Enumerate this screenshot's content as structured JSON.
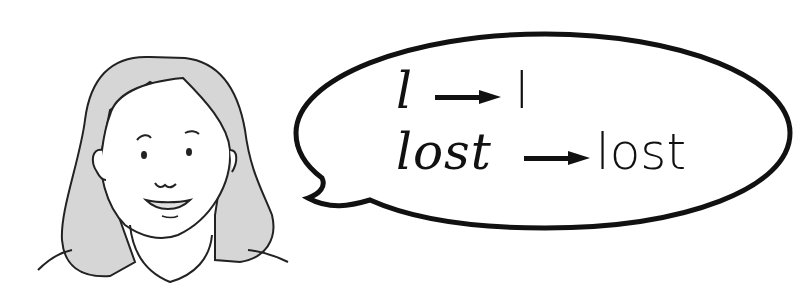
{
  "illustration": {
    "character": "girl-with-shoulder-length-hair",
    "speech_bubble": {
      "lines": [
        {
          "cursive": "l",
          "arrow": "right-arrow",
          "print": "l"
        },
        {
          "cursive": "lost",
          "arrow": "right-arrow",
          "print": "lost"
        }
      ]
    }
  },
  "colors": {
    "ink": "#111111",
    "hair_shade": "#c8c8c8",
    "background": "#ffffff"
  }
}
